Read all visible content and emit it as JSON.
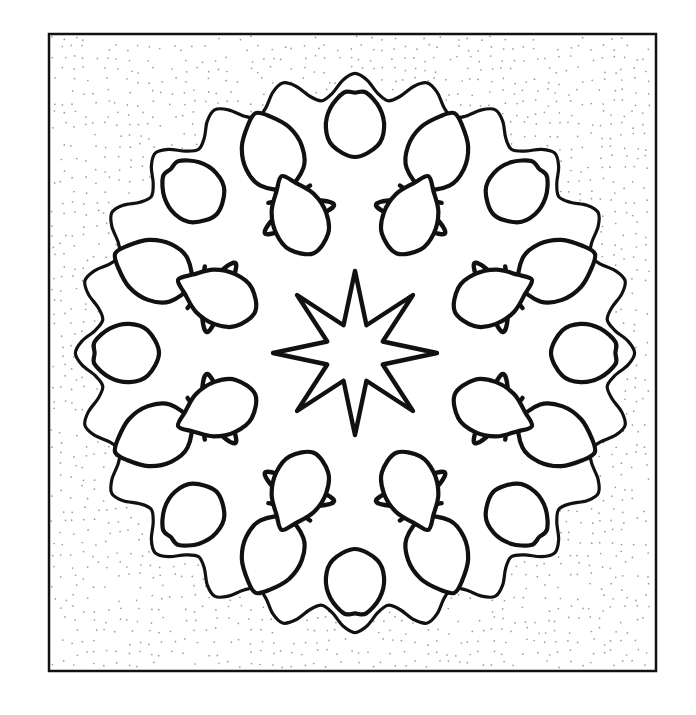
{
  "document": {
    "kind": "line-art-illustration",
    "subject": "Ornamental eight-fold radial mandala with stylized leaves",
    "style": "black ink outline on white with stippled dot shading",
    "canvas": {
      "width": 696,
      "height": 715
    },
    "background_color": "#ffffff"
  },
  "frame": {
    "name": "rectangular-border",
    "x": 49,
    "y": 34,
    "width": 607,
    "height": 637,
    "stroke_color": "#111111",
    "stroke_width": 2.5,
    "fill_color": "#ffffff"
  },
  "stipple": {
    "name": "dot-texture",
    "dot_color": "#9a9a9a",
    "dot_radius": 0.85,
    "spacing": 11,
    "jitter": 3.4,
    "description": "sparse random dot stipple filling the negative space of the design"
  },
  "ink": {
    "stroke_color": "#111111",
    "outer_border_stroke_width": 3.2,
    "motif_stroke_width": 4.4,
    "leaf_stroke_width": 4.2,
    "fill_color": "#ffffff"
  },
  "composition": {
    "center_x": 355,
    "center_y": 353,
    "symmetry_fold": 8,
    "rings": [
      {
        "name": "center-star",
        "type": "star",
        "points": 8,
        "outer_radius": 82,
        "inner_radius": 30,
        "fill": "white"
      },
      {
        "name": "inner-leaf-ring",
        "type": "leaves",
        "count": 8,
        "radius": 108,
        "leaf_length": 78,
        "leaf_width": 52
      },
      {
        "name": "middle-leaf-ring",
        "type": "leaves",
        "count": 8,
        "radius": 178,
        "leaf_length": 80,
        "leaf_width": 58
      },
      {
        "name": "outer-leaf-ring",
        "type": "leaves",
        "count": 8,
        "radius": 196,
        "leaf_length": 70,
        "leaf_width": 56
      },
      {
        "name": "scalloped-outer-boundary",
        "type": "wave",
        "base_radius": 252,
        "amplitude": 30,
        "lobes": 24
      }
    ]
  },
  "chart_data": {
    "type": "scatter",
    "xlabel": "",
    "ylabel": "",
    "categories": [
      "center-star",
      "inner-leaf-ring",
      "middle-leaf-ring",
      "outer-leaf-ring",
      "scalloped-boundary"
    ],
    "values": [
      82,
      108,
      178,
      196,
      252
    ],
    "series": [
      {
        "name": "element radius (px from center)",
        "values": [
          82,
          108,
          178,
          196,
          252
        ]
      },
      {
        "name": "element count",
        "values": [
          8,
          8,
          8,
          8,
          24
        ]
      }
    ],
    "ylim": [
      0,
      280
    ],
    "grid": false,
    "legend": "none"
  },
  "labels": {
    "artboard_name": "Ornamental mandala artboard"
  }
}
